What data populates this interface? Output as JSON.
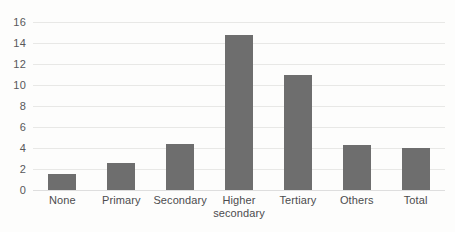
{
  "chart_data": {
    "type": "bar",
    "title": "",
    "subtitle": "",
    "xlabel": "",
    "ylabel": "",
    "categories": [
      "None",
      "Primary",
      "Secondary",
      "Higher secondary",
      "Tertiary",
      "Others",
      "Total"
    ],
    "category_lines": [
      [
        "None"
      ],
      [
        "Primary"
      ],
      [
        "Secondary"
      ],
      [
        "Higher",
        "secondary"
      ],
      [
        "Tertiary"
      ],
      [
        "Others"
      ],
      [
        "Total"
      ]
    ],
    "values": [
      1.5,
      2.6,
      4.4,
      14.8,
      11.0,
      4.3,
      4.0
    ],
    "ylim": [
      0,
      16
    ],
    "ytick_step": 2,
    "yticks": [
      16,
      14,
      12,
      10,
      8,
      6,
      4,
      2,
      0
    ],
    "grid": true,
    "legend": "none",
    "bar_color": "#6e6e6e",
    "gridline_color": "#e8e8e6",
    "background_color": "#fdfdfc",
    "tick_label_color": "#58585a"
  }
}
